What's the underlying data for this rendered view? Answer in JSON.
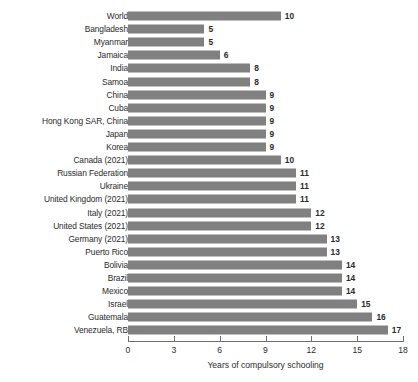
{
  "chart_data": {
    "type": "bar",
    "orientation": "horizontal",
    "title": "",
    "subtitle": "",
    "xlabel": "Years of compulsory schooling",
    "ylabel": "",
    "xlim": [
      0,
      18
    ],
    "xticks": [
      0,
      3,
      6,
      9,
      12,
      15,
      18
    ],
    "xticklabels": [
      "0",
      "3",
      "6",
      "9",
      "12",
      "15",
      "18"
    ],
    "grid": false,
    "legend": null,
    "bar_color": "#808080",
    "text_color": "#2b2b2b",
    "axis_color": "#6f6f6f",
    "value_labels_shown": true,
    "categories": [
      "World",
      "Bangladesh",
      "Myanmar",
      "Jamaica",
      "India",
      "Samoa",
      "China",
      "Cuba",
      "Hong Kong SAR, China",
      "Japan",
      "Korea",
      "Canada (2021)",
      "Russian Federation",
      "Ukraine",
      "United Kingdom (2021)",
      "Italy (2021)",
      "United States (2021)",
      "Germany (2021)",
      "Puerto Rico",
      "Bolivia",
      "Brazil",
      "Mexico",
      "Israel",
      "Guatemala",
      "Venezuela, RB"
    ],
    "values": [
      10,
      5,
      5,
      6,
      8,
      8,
      9,
      9,
      9,
      9,
      9,
      10,
      11,
      11,
      11,
      12,
      12,
      13,
      13,
      14,
      14,
      14,
      15,
      16,
      17
    ],
    "value_labels": [
      "10",
      "5",
      "5",
      "6",
      "8",
      "8",
      "9",
      "9",
      "9",
      "9",
      "9",
      "10",
      "11",
      "11",
      "11",
      "12",
      "12",
      "13",
      "13",
      "14",
      "14",
      "14",
      "15",
      "16",
      "17"
    ]
  }
}
